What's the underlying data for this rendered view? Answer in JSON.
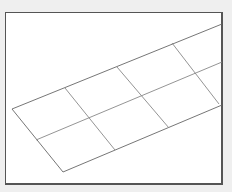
{
  "canvas": {
    "background": "#efefef",
    "frame_fill": "#ffffff",
    "frame_border": "#555555",
    "line_color": "#777777"
  },
  "grid": {
    "rows": 2,
    "columns": 4,
    "outline": [
      [
        12,
        109
      ],
      [
        222,
        24
      ],
      [
        222,
        105
      ],
      [
        63,
        172
      ]
    ],
    "top_edge": [
      [
        12,
        109
      ],
      [
        222,
        24
      ]
    ],
    "bottom_edge": [
      [
        63,
        172
      ],
      [
        222,
        105
      ]
    ],
    "middle_line": [
      [
        36,
        140
      ],
      [
        222,
        62
      ]
    ],
    "column_lines": [
      [
        [
          65,
          88
        ],
        [
          115,
          150
        ]
      ],
      [
        [
          117,
          67
        ],
        [
          169,
          128
        ]
      ],
      [
        [
          172,
          43
        ],
        [
          219,
          104
        ]
      ]
    ]
  }
}
